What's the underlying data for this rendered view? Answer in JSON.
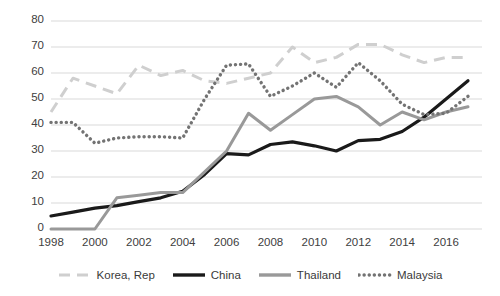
{
  "chart_data": {
    "type": "line",
    "title": "",
    "subtitle": "",
    "xlabel": "",
    "ylabel": "",
    "xlim": [
      1998,
      2017
    ],
    "ylim": [
      0,
      80
    ],
    "y_ticks": [
      0,
      10,
      20,
      30,
      40,
      50,
      60,
      70,
      80
    ],
    "x_ticks": [
      1998,
      2000,
      2002,
      2004,
      2006,
      2008,
      2010,
      2012,
      2014,
      2016
    ],
    "x": [
      1998,
      1999,
      2000,
      2001,
      2002,
      2003,
      2004,
      2005,
      2006,
      2007,
      2008,
      2009,
      2010,
      2011,
      2012,
      2013,
      2014,
      2015,
      2016,
      2017
    ],
    "grid": "horizontal",
    "legend_position": "bottom",
    "series": [
      {
        "name": "Korea, Rep",
        "style": "dashed",
        "color": "#cfcfcf",
        "values": [
          45,
          58,
          55,
          52,
          63,
          59,
          61,
          57,
          56,
          58,
          60,
          70,
          64,
          66,
          71,
          71,
          67,
          64,
          66,
          66
        ]
      },
      {
        "name": "China",
        "style": "solid",
        "color": "#1a1a1a",
        "values": [
          5,
          6.5,
          8,
          9,
          10.5,
          12,
          14.5,
          21,
          29,
          28.5,
          32.5,
          33.5,
          32,
          30,
          34,
          34.5,
          37.5,
          43,
          50,
          57
        ]
      },
      {
        "name": "Thailand",
        "style": "solid",
        "color": "#999999",
        "values": [
          0,
          0,
          0,
          12,
          13,
          14,
          14,
          22,
          30,
          44.5,
          38,
          44,
          50,
          51,
          47,
          40,
          45,
          42,
          45,
          47
        ]
      },
      {
        "name": "Malaysia",
        "style": "dotted",
        "color": "#737373",
        "values": [
          41,
          41,
          33,
          35,
          35.5,
          35.5,
          35,
          50,
          63,
          63.5,
          51,
          55,
          60,
          54.5,
          64,
          57,
          48,
          44,
          44.5,
          51
        ]
      }
    ]
  },
  "axes": {
    "y_tick_labels": [
      "80",
      "70",
      "60",
      "50",
      "40",
      "30",
      "20",
      "10",
      "0"
    ],
    "x_tick_labels": [
      "1998",
      "2000",
      "2002",
      "2004",
      "2006",
      "2008",
      "2010",
      "2012",
      "2014",
      "2016"
    ]
  },
  "legend": {
    "items": [
      {
        "label": "Korea, Rep",
        "swatch": "dashed-line-swatch"
      },
      {
        "label": "China",
        "swatch": "solid-black-line-swatch"
      },
      {
        "label": "Thailand",
        "swatch": "solid-gray-line-swatch"
      },
      {
        "label": "Malaysia",
        "swatch": "dotted-line-swatch"
      }
    ]
  },
  "colors": {
    "korea": "#cfcfcf",
    "china": "#1a1a1a",
    "thailand": "#999999",
    "malaysia": "#737373",
    "gridline": "#d9d9d9",
    "axis_text": "#404040",
    "background": "#ffffff"
  }
}
